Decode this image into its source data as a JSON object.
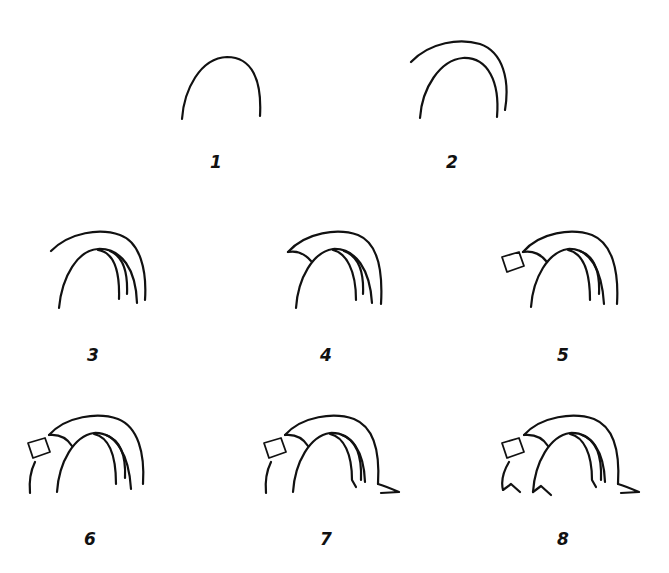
{
  "colors": {
    "background": "#ffffff",
    "ink": "#111111"
  },
  "steps": [
    {
      "number": "1",
      "label_pos": [
        214,
        163
      ]
    },
    {
      "number": "2",
      "label_pos": [
        451,
        163
      ]
    },
    {
      "number": "3",
      "label_pos": [
        92,
        356
      ]
    },
    {
      "number": "4",
      "label_pos": [
        325,
        356
      ]
    },
    {
      "number": "5",
      "label_pos": [
        562,
        356
      ]
    },
    {
      "number": "6",
      "label_pos": [
        89,
        540
      ]
    },
    {
      "number": "7",
      "label_pos": [
        325,
        540
      ]
    },
    {
      "number": "8",
      "label_pos": [
        562,
        540
      ]
    }
  ]
}
